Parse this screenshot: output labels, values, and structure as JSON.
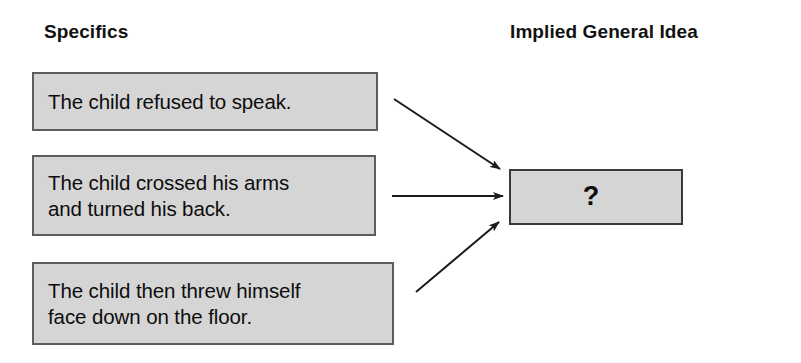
{
  "diagram": {
    "type": "inference-flow-diagram",
    "background_color": "#ffffff",
    "box_fill_color": "#d5d5d5",
    "box_border_color": "#5d5d5d",
    "text_color": "#0d0d0d",
    "headers": {
      "left": "Specifics",
      "right": "Implied General Idea"
    },
    "specifics": [
      {
        "id": "specific-1",
        "text": "The child refused to speak."
      },
      {
        "id": "specific-2",
        "text": "The child crossed his arms\nand turned his back."
      },
      {
        "id": "specific-3",
        "text": "The child then threw himself\nface down on the floor."
      }
    ],
    "conclusion": {
      "id": "implied-idea",
      "text": "?"
    },
    "arrows": [
      {
        "id": "arrow-1",
        "from": "specific-1",
        "to": "implied-idea",
        "direction": "down-right"
      },
      {
        "id": "arrow-2",
        "from": "specific-2",
        "to": "implied-idea",
        "direction": "right"
      },
      {
        "id": "arrow-3",
        "from": "specific-3",
        "to": "implied-idea",
        "direction": "up-right"
      }
    ]
  }
}
